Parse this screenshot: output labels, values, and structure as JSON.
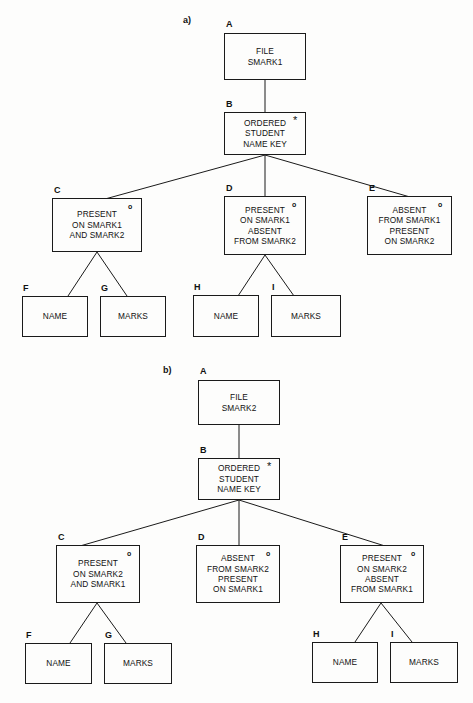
{
  "figure": {
    "background_color": "#fdfdfc",
    "line_color": "#1a1a1a",
    "text_color": "#111111"
  },
  "sections": [
    {
      "id": "a",
      "label": "a)",
      "nodes": [
        {
          "key": "A",
          "id_label": "A",
          "marker": "",
          "lines": [
            "FILE",
            "SMARK1"
          ]
        },
        {
          "key": "B",
          "id_label": "B",
          "marker": "*",
          "lines": [
            "ORDERED",
            "STUDENT",
            "NAME KEY"
          ]
        },
        {
          "key": "C",
          "id_label": "C",
          "marker": "o",
          "lines": [
            "PRESENT",
            "ON SMARK1",
            "AND SMARK2"
          ]
        },
        {
          "key": "D",
          "id_label": "D",
          "marker": "o",
          "lines": [
            "PRESENT",
            "ON SMARK1",
            "ABSENT",
            "FROM SMARK2"
          ]
        },
        {
          "key": "E",
          "id_label": "E",
          "marker": "o",
          "lines": [
            "ABSENT",
            "FROM SMARK1",
            "PRESENT",
            "ON SMARK2"
          ]
        },
        {
          "key": "F",
          "id_label": "F",
          "marker": "",
          "lines": [
            "NAME"
          ]
        },
        {
          "key": "G",
          "id_label": "G",
          "marker": "",
          "lines": [
            "MARKS"
          ]
        },
        {
          "key": "H",
          "id_label": "H",
          "marker": "",
          "lines": [
            "NAME"
          ]
        },
        {
          "key": "I",
          "id_label": "I",
          "marker": "",
          "lines": [
            "MARKS"
          ]
        }
      ]
    },
    {
      "id": "b",
      "label": "b)",
      "nodes": [
        {
          "key": "A",
          "id_label": "A",
          "marker": "",
          "lines": [
            "FILE",
            "SMARK2"
          ]
        },
        {
          "key": "B",
          "id_label": "B",
          "marker": "*",
          "lines": [
            "ORDERED",
            "STUDENT",
            "NAME KEY"
          ]
        },
        {
          "key": "C",
          "id_label": "C",
          "marker": "o",
          "lines": [
            "PRESENT",
            "ON SMARK2",
            "AND SMARK1"
          ]
        },
        {
          "key": "D",
          "id_label": "D",
          "marker": "o",
          "lines": [
            "ABSENT",
            "FROM SMARK2",
            "PRESENT",
            "ON SMARK1"
          ]
        },
        {
          "key": "E",
          "id_label": "E",
          "marker": "o",
          "lines": [
            "PRESENT",
            "ON SMARK2",
            "ABSENT",
            "FROM SMARK1"
          ]
        },
        {
          "key": "F",
          "id_label": "F",
          "marker": "",
          "lines": [
            "NAME"
          ]
        },
        {
          "key": "G",
          "id_label": "G",
          "marker": "",
          "lines": [
            "MARKS"
          ]
        },
        {
          "key": "H",
          "id_label": "H",
          "marker": "",
          "lines": [
            "NAME"
          ]
        },
        {
          "key": "I",
          "id_label": "I",
          "marker": "",
          "lines": [
            "MARKS"
          ]
        }
      ]
    }
  ]
}
